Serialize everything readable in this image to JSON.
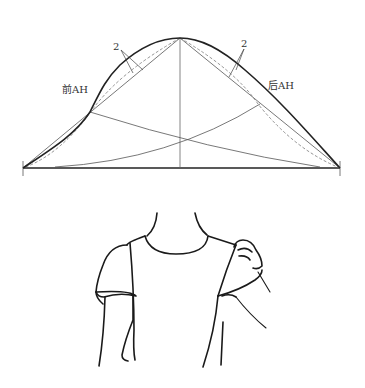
{
  "diagram": {
    "top": {
      "labels": {
        "front_armhole": "前AH",
        "back_armhole": "后AH",
        "front_ease": "2",
        "back_ease": "2"
      },
      "colors": {
        "stroke_main": "#222222",
        "stroke_guide": "#555555",
        "stroke_dashed": "#777777"
      }
    },
    "bottom": {
      "description": "sleeve cap fitting on bodice illustration"
    }
  }
}
